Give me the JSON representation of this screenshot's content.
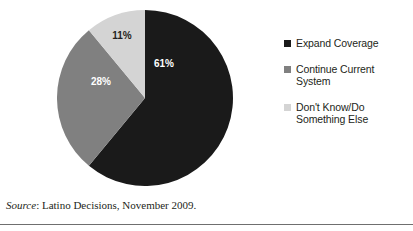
{
  "chart_data": {
    "type": "pie",
    "title": "",
    "categories": [
      "Expand Coverage",
      "Continue Current System",
      "Don't Know/Do Something Else"
    ],
    "values": [
      61,
      28,
      11
    ],
    "value_labels": [
      "61%",
      "28%",
      "11%"
    ],
    "colors": [
      "#1a1a1a",
      "#808080",
      "#d4d4d4"
    ],
    "label_text_colors": [
      "#ffffff",
      "#ffffff",
      "#231f20"
    ],
    "start_angle_deg": 0,
    "direction": "clockwise",
    "legend_position": "right",
    "grid": false,
    "xlabel": "",
    "ylabel": ""
  },
  "legend": {
    "items": [
      {
        "label": "Expand Coverage",
        "color": "#1a1a1a"
      },
      {
        "label": "Continue Current System",
        "color": "#808080"
      },
      {
        "label": "Don't Know/Do Something Else",
        "color": "#d4d4d4"
      }
    ]
  },
  "slice_labels": {
    "expand_coverage": "61%",
    "continue_current_system": "28%",
    "dont_know": "11%"
  },
  "source": {
    "prefix": "Source",
    "separator": ": ",
    "text": "Latino Decisions, November 2009."
  }
}
